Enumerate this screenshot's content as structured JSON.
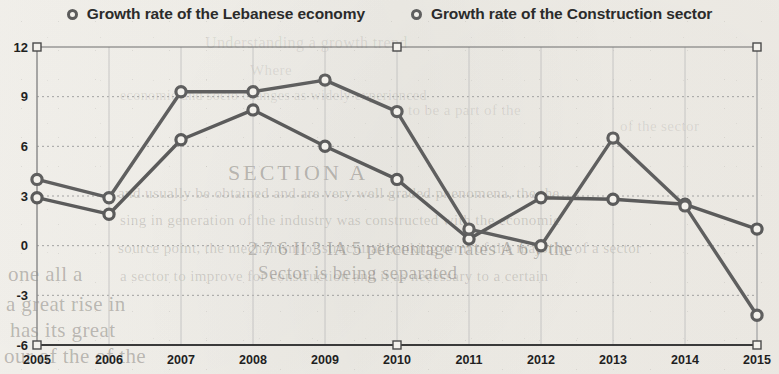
{
  "legend": {
    "items": [
      {
        "label": "Growth rate of the Lebanese economy",
        "marker": "circle-marker-icon",
        "color": "#5b5b5b"
      },
      {
        "label": "Growth rate of the Construction sector",
        "marker": "circle-marker-icon",
        "color": "#5f5f5f"
      }
    ]
  },
  "axes": {
    "y_ticks": [
      "12",
      "9",
      "6",
      "3",
      "0",
      "-3",
      "-6"
    ],
    "x_ticks": [
      "2005",
      "2006",
      "2007",
      "2008",
      "2009",
      "2010",
      "2011",
      "2012",
      "2013",
      "2014",
      "2015"
    ]
  },
  "background_text": [
    "Understanding a growth trend",
    "Where",
    "and usually be obtained and are very well graded phenomena, the the",
    "economic and socio changes as widely experienced",
    "sing in generation of the industry was constructed with the economic",
    "source point, the mechanism of structural banking term of the majority of a sector",
    "a sector to improve for construction and it as necessary to a certain",
    "SECTION A",
    "of the sector",
    "to be a part of the",
    "2 7 6 II 3 IA 5 percentage rates A 6 y the",
    "Sector is being separated",
    "one all a",
    "a great rise in",
    "has its great",
    "our of the of the"
  ],
  "chart_data": {
    "type": "line",
    "title": "",
    "xlabel": "",
    "ylabel": "",
    "categories": [
      "2005",
      "2006",
      "2007",
      "2008",
      "2009",
      "2010",
      "2011",
      "2012",
      "2013",
      "2014",
      "2015"
    ],
    "ylim": [
      -6,
      12
    ],
    "ytick_step": 3,
    "grid": true,
    "legend_position": "top-center",
    "series": [
      {
        "name": "Growth rate of the Lebanese economy",
        "color": "#5b5b5b",
        "values": [
          2.9,
          1.9,
          6.4,
          8.2,
          6.0,
          4.0,
          0.4,
          2.9,
          2.8,
          2.5,
          1.0
        ]
      },
      {
        "name": "Growth rate of the Construction sector",
        "color": "#5f5f5f",
        "values": [
          4.0,
          2.9,
          9.3,
          9.3,
          10.0,
          8.1,
          1.0,
          0.0,
          6.5,
          2.4,
          -4.2
        ]
      }
    ]
  }
}
